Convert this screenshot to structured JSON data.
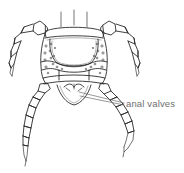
{
  "figure": {
    "background_color": "#ffffff",
    "ink_color": "#2b2b2b",
    "label_color": "#6f6f6f"
  },
  "annotations": [
    {
      "id": "anal-valves",
      "label": "anal valves",
      "label_x": 126,
      "label_y": 99,
      "leader_lines": [
        {
          "x1": 124,
          "y1": 103,
          "x2": 79,
          "y2": 92
        },
        {
          "x1": 124,
          "y1": 105,
          "x2": 80,
          "y2": 96
        }
      ]
    }
  ],
  "anatomy": {
    "body_segments": [
      "tergite-anterior",
      "tergite-median",
      "lateral-plate-left",
      "lateral-plate-right",
      "sternite-posterior",
      "anal-valve-pair"
    ],
    "appendages": [
      "leg-upper-left",
      "leg-upper-right",
      "leg-lower-left",
      "leg-lower-right"
    ],
    "setae_count": 2
  }
}
